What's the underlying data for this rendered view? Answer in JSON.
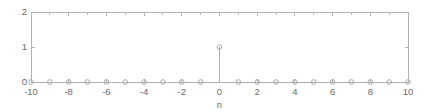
{
  "chart_data": {
    "type": "scatter",
    "plot_style": "stem",
    "title": "",
    "subtitle": "",
    "xlabel": "n",
    "ylabel": "",
    "x": [
      -10,
      -9,
      -8,
      -7,
      -6,
      -5,
      -4,
      -3,
      -2,
      -1,
      0,
      1,
      2,
      3,
      4,
      5,
      6,
      7,
      8,
      9,
      10
    ],
    "values": [
      0,
      0,
      0,
      0,
      0,
      0,
      0,
      0,
      0,
      0,
      1,
      0,
      0,
      0,
      0,
      0,
      0,
      0,
      0,
      0,
      0
    ],
    "series": [
      {
        "name": "delta[n]",
        "values": [
          0,
          0,
          0,
          0,
          0,
          0,
          0,
          0,
          0,
          0,
          1,
          0,
          0,
          0,
          0,
          0,
          0,
          0,
          0,
          0,
          0
        ]
      }
    ],
    "xlim": [
      -10,
      10
    ],
    "ylim": [
      0,
      2
    ],
    "xticks": [
      -10,
      -8,
      -6,
      -4,
      -2,
      0,
      2,
      4,
      6,
      8,
      10
    ],
    "xtick_labels": [
      "-10",
      "-8",
      "-6",
      "-4",
      "-2",
      "0",
      "2",
      "4",
      "6",
      "8",
      "10"
    ],
    "yticks": [
      0,
      1,
      2
    ],
    "ytick_labels": [
      "0",
      "1",
      "2"
    ],
    "minor_xticks": [
      -9,
      -7,
      -5,
      -3,
      -1,
      1,
      3,
      5,
      7,
      9
    ],
    "grid": false,
    "legend": null,
    "legend_position": "none",
    "annotations": [],
    "marker": "open-circle",
    "line_color": "#b0b0b0",
    "marker_color": "#a8a8a8",
    "axis_color": "#b4b4b4",
    "tick_label_color": "#6b6b6b",
    "background_color": "#ffffff"
  }
}
